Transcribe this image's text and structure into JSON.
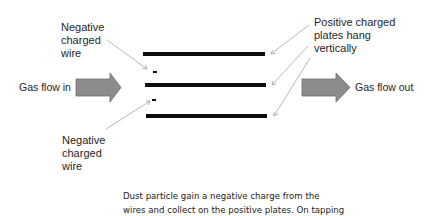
{
  "labels": {
    "negative_wire_top": [
      "Negative",
      "charged",
      "wire"
    ],
    "negative_wire_bottom": [
      "Negative",
      "charged",
      "wire"
    ],
    "positive_plates": [
      "Positive charged",
      "plates hang",
      "vertically"
    ],
    "gas_in": "Gas flow in",
    "gas_out": "Gas flow out"
  },
  "wire_charge_symbol": "-",
  "caption": {
    "lines": [
      "Dust particle gain a negative charge from the",
      "wires and collect on the positive plates. On tapping"
    ]
  },
  "colors": {
    "plate": "#0d0d0d",
    "arrow_fill": "#8c8c8c",
    "arrow_stroke": "#6e6e6e",
    "pointer_line": "#a6a6a6",
    "text": "#262626"
  }
}
